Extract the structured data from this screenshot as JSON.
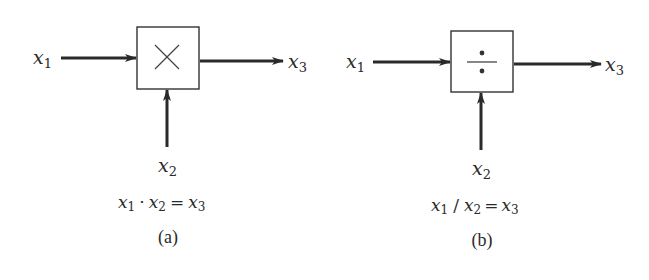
{
  "diagrams": [
    {
      "id": "a",
      "operation": "multiplication",
      "operator_symbol": "×",
      "inputs": {
        "left": {
          "var": "x",
          "sub": "1"
        },
        "bottom": {
          "var": "x",
          "sub": "2"
        }
      },
      "output": {
        "var": "x",
        "sub": "3"
      },
      "equation": {
        "parts": [
          {
            "var": "x",
            "sub": "1"
          },
          {
            "op": "·"
          },
          {
            "var": "x",
            "sub": "2"
          },
          {
            "op": "="
          },
          {
            "var": "x",
            "sub": "3"
          }
        ],
        "text": "x1 · x2 = x3"
      },
      "caption": "(a)"
    },
    {
      "id": "b",
      "operation": "division",
      "operator_symbol": "÷",
      "inputs": {
        "left": {
          "var": "x",
          "sub": "1"
        },
        "bottom": {
          "var": "x",
          "sub": "2"
        }
      },
      "output": {
        "var": "x",
        "sub": "3"
      },
      "equation": {
        "parts": [
          {
            "var": "x",
            "sub": "1"
          },
          {
            "op": "/"
          },
          {
            "var": "x",
            "sub": "2"
          },
          {
            "op": "="
          },
          {
            "var": "x",
            "sub": "3"
          }
        ],
        "text": "x1 / x2 = x3"
      },
      "caption": "(b)"
    }
  ],
  "colors": {
    "ink": "#2a2a2a",
    "background": "#ffffff"
  }
}
